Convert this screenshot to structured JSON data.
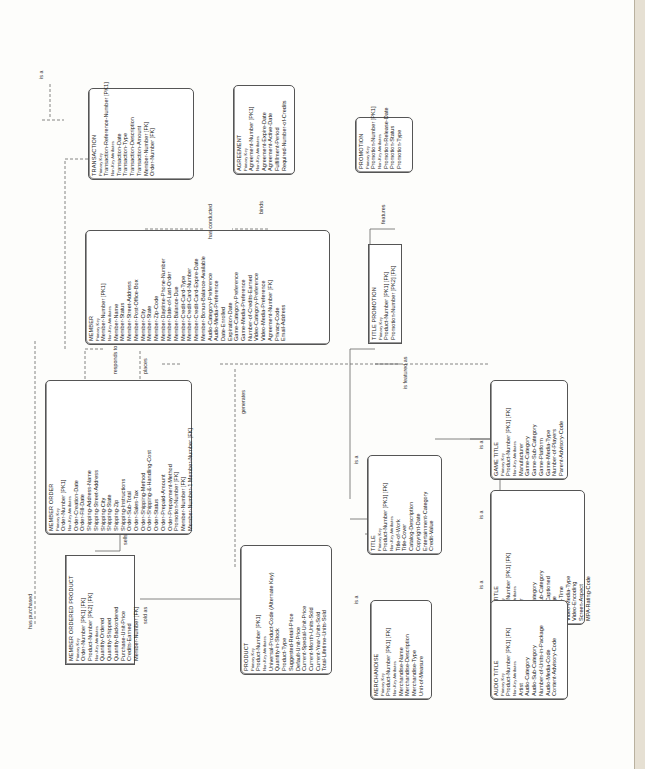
{
  "diagram": {
    "type": "entity-relationship",
    "orientation": "rotated-90",
    "entities": {
      "transaction": {
        "name": "TRANSACTION",
        "pk_label": "Primary Key",
        "pk": "Transaction-Reference-Number   [PK1]",
        "nk_label": "Non-Key Attributes",
        "attrs": [
          "Transaction-Date",
          "Transaction-Type",
          "Transaction-Description",
          "Transaction-Amount",
          "Member-Number  [FK]",
          "Order-Number  [FK]"
        ]
      },
      "agreement": {
        "name": "AGREEMENT",
        "pk_label": "Primary Key",
        "pk": "Agreement-Number   [PK1]",
        "nk_label": "Non-Key Attributes",
        "attrs": [
          "Agreement-Expire-Date",
          "Agreement-Active-Date",
          "Fulfillment-Period",
          "Required-Number-of-Credits"
        ]
      },
      "promotion": {
        "name": "PROMOTION",
        "pk_label": "Primary Key",
        "pk": "Promotion-Number   [PK1]",
        "nk_label": "Non-Key Attributes",
        "attrs": [
          "Promotion-Release-Date",
          "Promotion-Status",
          "Promotion-Type"
        ]
      },
      "member": {
        "name": "MEMBER",
        "pk_label": "Primary Key",
        "pk": "Member-Number   [PK1]",
        "nk_label": "Non-Key Attributes",
        "attrs": [
          "Member-Name",
          "Member-Status",
          "Member-Street-Address",
          "Member-Post-Office-Box",
          "Member-City",
          "Member-State",
          "Member-Zip-Code",
          "Member-Daytime-Phone-Number",
          "Member-Date-of-Last-Order",
          "Member-Balance-Due",
          "Member-Credit-Card-Type",
          "Member-Credit-Card-Number",
          "Member-Credit-Card-Expire-Date",
          "Member-Bonus-Balance-Available",
          "Audio-Category-Preference",
          "Audio-Media-Preference",
          "Date-Enrolled",
          "Expiration-Date",
          "Game-Category-Preference",
          "Game-Media-Preference",
          "Number-of-Credits-Earned",
          "Video-Category-Preference",
          "Video-Media-Preference",
          "Agreement-Number  [FK]",
          "Privacy-Code",
          "Email-Address"
        ]
      },
      "title_promotion": {
        "name": "TITLE PROMOTION",
        "pk_label": "Primary Key",
        "pk": "Product-Number   [PK1]  [FK]",
        "pk2": "Promotion-Number   [PK2]  [FK]"
      },
      "member_order": {
        "name": "MEMBER ORDER",
        "pk_label": "Primary Key",
        "pk": "Order-Number   [PK1]",
        "nk_label": "Non-Key Attributes",
        "attrs": [
          "Order-Creation-Date",
          "Order-Fill-Date",
          "Shipping-Address-Name",
          "Shipping-Street-Address",
          "Shipping-City",
          "Shipping-State",
          "Shipping-Zip",
          "Shipping-Instructions",
          "Order-Sub-Total",
          "Order-Sales-Tax",
          "Order-Shipping-Method",
          "Order-Shipping-&-Handling-Cost",
          "Order-Status",
          "Order-Prepaid-Amount",
          "Order-Prepayment-Method",
          "Promotion-Number  [FK]",
          "Member-Number  [FK]",
          "Member-Number-1    Member-Number  [FK]"
        ]
      },
      "member_ordered_product": {
        "name": "MEMBER ORDERED PRODUCT",
        "pk_label": "Primary Key",
        "pk": "Order-Number   [PK1]  [FK]",
        "pk2": "Product-Number   [PK2]  [FK]",
        "nk_label": "Non-Key Attributes",
        "attrs": [
          "Quantity-Ordered",
          "Quantity-Shipped",
          "Quantity-Backordered",
          "Purchase-Unit-Price",
          "Credits-Earned",
          "Member-Number  [FK]"
        ]
      },
      "product": {
        "name": "PRODUCT",
        "pk_label": "Primary Key",
        "pk": "Product-Number   [PK1]",
        "nk_label": "Non-Key Attributes",
        "attrs": [
          "Universal-Product-Code (Alternate Key)",
          "Quantity-in-Stock",
          "Product-Type",
          "Suggested-Retail-Price",
          "Default-Unit-Price",
          "Current-Special-Unit-Price",
          "Current-Month-Units-Sold",
          "Current-Year-Units-Sold",
          "Total-Lifetime-Units-Sold"
        ]
      },
      "title": {
        "name": "TITLE",
        "pk_label": "Primary Key",
        "pk": "Product-Number   [PK1]  [FK]",
        "nk_label": "Non-Key Attributes",
        "attrs": [
          "Title-of-Work",
          "Title-Cover",
          "Catalog-Description",
          "Copyright-Date",
          "Entertainment-Category",
          "Credit-Value"
        ]
      },
      "merchandise": {
        "name": "MERCHANDISE",
        "pk_label": "Primary Key",
        "pk": "Product-Number   [PK1]  [FK]",
        "nk_label": "Non-Key Attributes",
        "attrs": [
          "Merchandise-Name",
          "Merchandise-Description",
          "Merchandise-Type",
          "Unit-of-Measure"
        ]
      },
      "game_title": {
        "name": "GAME TITLE",
        "pk_label": "Primary Key",
        "pk": "Product-Number   [PK1]  [FK]",
        "nk_label": "Non-Key Attributes",
        "attrs": [
          "Manufacturer",
          "Game-Category",
          "Game-Sub-Category",
          "Game-Platform",
          "Game-Media-Type",
          "Number-of-Players",
          "Parent-Advisory-Code"
        ]
      },
      "video_title": {
        "name": "VIDEO TITLE",
        "pk_label": "Primary Key",
        "pk": "Product-Number   [PK1]  [FK]",
        "nk_label": "Non-Key Attributes",
        "attrs": [
          "Producer",
          "Director",
          "Video-Category",
          "Video-Sub-Category",
          "Closed-Captioned",
          "Language",
          "Running-Time",
          "Video-Media-Type",
          "Video-Encoding",
          "Screen-Aspect",
          "MPA-Rating-Code"
        ]
      },
      "audio_title": {
        "name": "AUDIO TITLE",
        "pk_label": "Primary Key",
        "pk": "Product-Number   [PK1]  [FK]",
        "nk_label": "Non-Key Attributes",
        "attrs": [
          "Artist",
          "Audio-Category",
          "Audio-Sub-Category",
          "Number-of-Units-in-Package",
          "Audio-Media-Code",
          "Content-Advisory-Code"
        ]
      }
    },
    "relationships": {
      "is_a_top": "is a",
      "has_conducted": "has conducted",
      "binds": "binds",
      "features": "features",
      "responds_to": "responds to",
      "places": "places",
      "is_featured_as": "is featured as",
      "generates": "generates",
      "sells": "sells",
      "has_purchased": "has purchased",
      "sold_as": "sold as",
      "is_a_title": "is a",
      "is_a_merch": "is a",
      "is_a_game": "is a",
      "is_a_video": "is a",
      "is_a_audio": "is a"
    }
  }
}
